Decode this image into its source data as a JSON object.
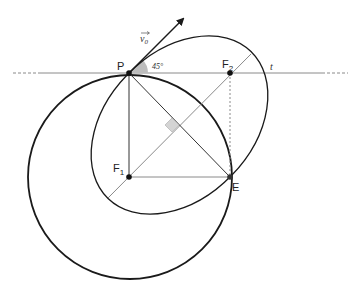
{
  "diagram": {
    "type": "orbital-geometry",
    "points": {
      "P": {
        "label": "P",
        "x": 129,
        "y": 73
      },
      "F1": {
        "label": "F",
        "sub": "1",
        "x": 129,
        "y": 177
      },
      "F2": {
        "label": "F",
        "sub": "2",
        "x": 230,
        "y": 73
      },
      "E": {
        "label": "E",
        "x": 230,
        "y": 177
      }
    },
    "labels": {
      "velocity": "v",
      "velocity_sub": "0",
      "angle": "45°",
      "tangent_line": "t"
    },
    "colors": {
      "thick_stroke": "#1a1a1a",
      "thin_stroke": "#333333",
      "gray_stroke": "#8a8a8a",
      "angle_fill": "#bdbdbd",
      "right_angle_fill": "#d4d4d4"
    }
  }
}
